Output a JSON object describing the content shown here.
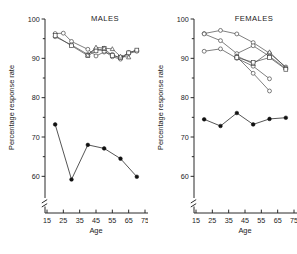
{
  "figure": {
    "width": 297,
    "height": 254,
    "background": "#ffffff",
    "ink": "#1a1a1a"
  },
  "chart_data": [
    {
      "type": "line",
      "title": "MALES",
      "xlabel": "Age",
      "ylabel": "Percentage response rate",
      "xlim": [
        13,
        77
      ],
      "ylim": [
        55,
        100
      ],
      "xticks": [
        15,
        25,
        35,
        45,
        55,
        65,
        75
      ],
      "yticks": [
        60,
        70,
        80,
        90,
        100
      ],
      "yminorticks": [
        65,
        75,
        85,
        95
      ],
      "grid": false,
      "legend": "none",
      "axis_break": "y-axis broken below 58",
      "series": [
        {
          "name": "open-circle-series-1",
          "marker": "open-circle",
          "x": [
            20,
            25,
            30,
            40,
            45,
            50,
            55,
            60,
            65,
            70
          ],
          "values": [
            96.3,
            96.4,
            94.3,
            92.3,
            90.6,
            91.6,
            91.0,
            90.0,
            91.5,
            92.0
          ]
        },
        {
          "name": "open-circle-series-2",
          "marker": "open-circle",
          "x": [
            20,
            30,
            40,
            45,
            50,
            55,
            60,
            65,
            70
          ],
          "values": [
            95.5,
            93.4,
            91.0,
            92.4,
            91.8,
            90.4,
            89.8,
            91.2,
            91.8
          ]
        },
        {
          "name": "open-square-series-1",
          "marker": "open-square",
          "x": [
            20,
            30,
            40,
            45,
            50,
            55,
            60,
            65,
            70
          ],
          "values": [
            95.8,
            93.2,
            90.7,
            91.9,
            92.5,
            90.7,
            90.2,
            91.4,
            92.1
          ]
        },
        {
          "name": "open-triangle-series-1",
          "marker": "open-triangle",
          "x": [
            40,
            45,
            50,
            55,
            60,
            65
          ],
          "values": [
            90.8,
            92.8,
            92.6,
            92.4,
            90.5,
            90.3
          ]
        },
        {
          "name": "filled-circle-series",
          "marker": "filled-circle",
          "x": [
            20,
            30,
            40,
            50,
            60,
            70
          ],
          "values": [
            73.2,
            59.2,
            68.0,
            67.1,
            64.5,
            59.9
          ]
        }
      ]
    },
    {
      "type": "line",
      "title": "FEMALES",
      "xlabel": "Age",
      "ylabel": "Percentage response rate",
      "xlim": [
        13,
        77
      ],
      "ylim": [
        55,
        100
      ],
      "xticks": [
        15,
        25,
        35,
        45,
        55,
        65,
        75
      ],
      "yticks": [
        60,
        70,
        80,
        90,
        100
      ],
      "yminorticks": [
        65,
        75,
        85,
        95
      ],
      "grid": false,
      "legend": "none",
      "axis_break": "y-axis broken below 58",
      "series": [
        {
          "name": "open-circle-series-1",
          "marker": "open-circle",
          "x": [
            20,
            30,
            40,
            50,
            60,
            70
          ],
          "values": [
            96.3,
            97.1,
            96.2,
            94.0,
            91.3,
            87.8
          ]
        },
        {
          "name": "open-circle-series-2",
          "marker": "open-circle",
          "x": [
            20,
            30,
            40,
            50,
            60,
            70
          ],
          "values": [
            96.2,
            94.5,
            91.2,
            93.2,
            90.5,
            87.4
          ]
        },
        {
          "name": "open-circle-series-3",
          "marker": "open-circle",
          "x": [
            20,
            30,
            40,
            50,
            60
          ],
          "values": [
            91.8,
            92.4,
            90.0,
            88.0,
            84.8
          ]
        },
        {
          "name": "open-triangle-series-1",
          "marker": "open-triangle",
          "x": [
            40,
            50,
            60,
            70
          ],
          "values": [
            90.6,
            88.6,
            91.6,
            87.6
          ]
        },
        {
          "name": "open-circle-series-4",
          "marker": "open-circle",
          "x": [
            40,
            50,
            60
          ],
          "values": [
            90.4,
            86.2,
            81.7
          ]
        },
        {
          "name": "open-square-series-1",
          "marker": "open-square",
          "x": [
            40,
            50,
            60,
            70
          ],
          "values": [
            90.2,
            89.0,
            90.2,
            87.2
          ]
        },
        {
          "name": "filled-circle-series",
          "marker": "filled-circle",
          "x": [
            20,
            30,
            40,
            50,
            60,
            70
          ],
          "values": [
            74.5,
            72.8,
            76.1,
            73.2,
            74.6,
            74.9
          ]
        }
      ]
    }
  ]
}
